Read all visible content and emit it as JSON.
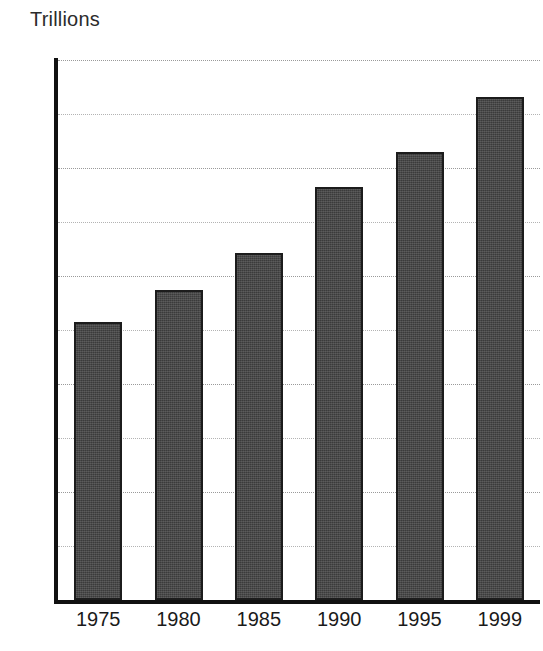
{
  "chart_data": {
    "type": "bar",
    "title": "Trillions",
    "subtitle": "",
    "xlabel": "",
    "ylabel": "Trillions",
    "categories": [
      "1975",
      "1980",
      "1985",
      "1990",
      "1995",
      "1999"
    ],
    "values": [
      2.57,
      2.87,
      3.21,
      3.82,
      4.15,
      4.66
    ],
    "series": [
      {
        "name": "Trillions",
        "values": [
          2.57,
          2.87,
          3.21,
          3.82,
          4.15,
          4.66
        ]
      }
    ],
    "ylim": [
      0,
      5
    ],
    "xlim_categorical": true,
    "y_major_ticks": [
      0,
      1,
      2,
      3,
      4,
      5
    ],
    "y_major_tick_labels": [
      "0",
      "1",
      "2",
      "3",
      "4",
      "5"
    ],
    "y_minor_gridlines": [
      0.5,
      1.5,
      2.5,
      3.5,
      4.5
    ],
    "grid": "horizontal-dotted",
    "legend": "none",
    "legend_position": "",
    "annotations": [],
    "bar_color": "#3b3b3b",
    "bar_edge_color": "#1c1c1c",
    "axis_color": "#111111",
    "gridline_color": "#b3b3b3",
    "background_color": "#ffffff"
  },
  "axes": {
    "y_ticks": [
      {
        "value": 5,
        "label": "5",
        "major": true
      },
      {
        "value": 4.5,
        "label": "",
        "major": false
      },
      {
        "value": 4,
        "label": "4",
        "major": true
      },
      {
        "value": 3.5,
        "label": "",
        "major": false
      },
      {
        "value": 3,
        "label": "3",
        "major": true
      },
      {
        "value": 2.5,
        "label": "",
        "major": false
      },
      {
        "value": 2,
        "label": "2",
        "major": true
      },
      {
        "value": 1.5,
        "label": "",
        "major": false
      },
      {
        "value": 1,
        "label": "1",
        "major": true
      },
      {
        "value": 0.5,
        "label": "",
        "major": false
      },
      {
        "value": 0,
        "label": "0",
        "major": true
      }
    ]
  }
}
